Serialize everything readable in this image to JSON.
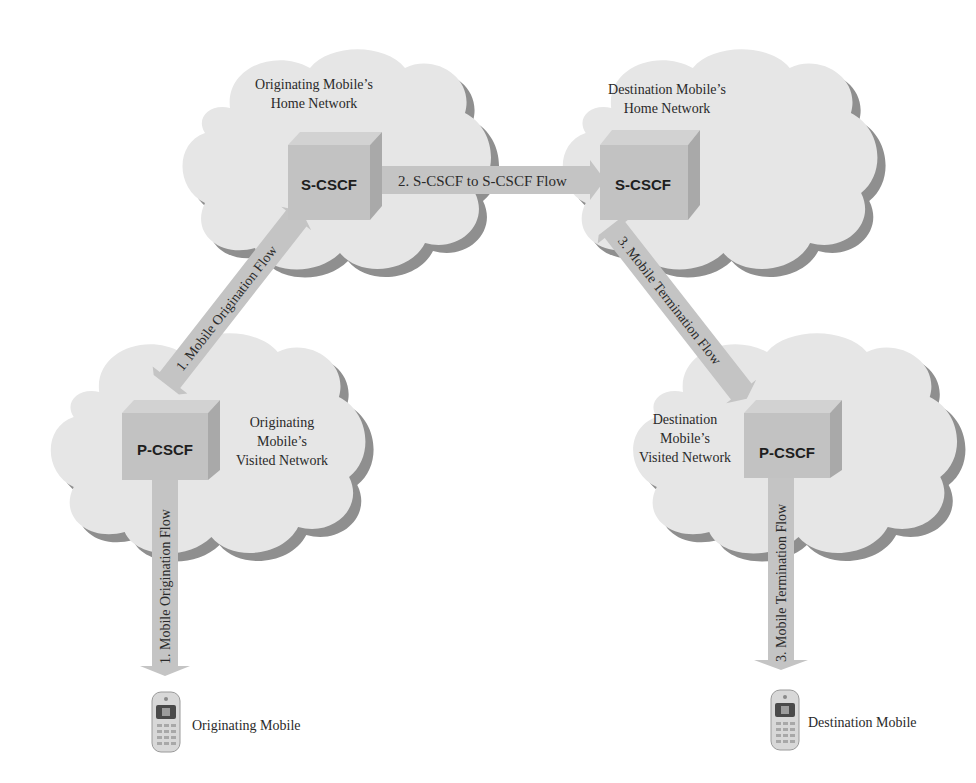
{
  "diagram": {
    "networks": {
      "orig_home": {
        "label_line1": "Originating Mobile’s",
        "label_line2": "Home Network",
        "node": "S-CSCF"
      },
      "dest_home": {
        "label_line1": "Destination Mobile’s",
        "label_line2": "Home Network",
        "node": "S-CSCF"
      },
      "orig_visited": {
        "label_line1": "Originating",
        "label_line2": "Mobile’s",
        "label_line3": "Visited Network",
        "node": "P-CSCF"
      },
      "dest_visited": {
        "label_line1": "Destination",
        "label_line2": "Mobile’s",
        "label_line3": "Visited Network",
        "node": "P-CSCF"
      }
    },
    "flows": {
      "orig_diag": "1. Mobile Origination Flow",
      "orig_vert": "1. Mobile Origination Flow",
      "scscf_to_scscf": "2. S-CSCF to S-CSCF Flow",
      "term_diag": "3. Mobile Termination Flow",
      "term_vert": "3. Mobile Termination Flow"
    },
    "endpoints": {
      "originating": {
        "label": "Originating Mobile",
        "icon": "mobile-phone-icon"
      },
      "destination": {
        "label": "Destination Mobile",
        "icon": "mobile-phone-icon"
      }
    }
  }
}
